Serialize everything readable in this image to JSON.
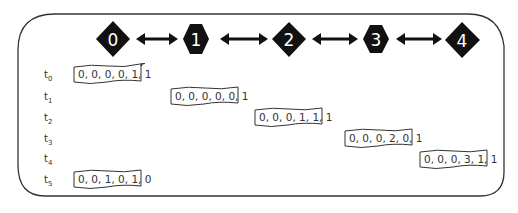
{
  "diagram": {
    "nodes": [
      {
        "id": "0",
        "label": "0",
        "shape": "diamond"
      },
      {
        "id": "1",
        "label": "1",
        "shape": "hexagon"
      },
      {
        "id": "2",
        "label": "2",
        "shape": "diamond"
      },
      {
        "id": "3",
        "label": "3",
        "shape": "hexagon"
      },
      {
        "id": "4",
        "label": "4",
        "shape": "diamond"
      }
    ],
    "edges": [
      {
        "from": "0",
        "to": "1",
        "type": "bidirectional"
      },
      {
        "from": "1",
        "to": "2",
        "type": "bidirectional"
      },
      {
        "from": "2",
        "to": "3",
        "type": "bidirectional"
      },
      {
        "from": "3",
        "to": "4",
        "type": "bidirectional"
      }
    ],
    "time_steps": [
      {
        "label": "t",
        "sub": "0",
        "node": "0",
        "vector": "0, 0, 0, 0, 1, 1"
      },
      {
        "label": "t",
        "sub": "1",
        "node": "1",
        "vector": "0, 0, 0, 0, 0, 1"
      },
      {
        "label": "t",
        "sub": "2",
        "node": "2",
        "vector": "0, 0, 0, 1, 1, 1"
      },
      {
        "label": "t",
        "sub": "3",
        "node": "3",
        "vector": "0, 0, 0, 2, 0, 1"
      },
      {
        "label": "t",
        "sub": "4",
        "node": "4",
        "vector": "0, 0, 0, 3, 1, 1"
      },
      {
        "label": "t",
        "sub": "5",
        "node": "0",
        "vector": "0, 0, 1, 0, 1, 0"
      }
    ],
    "colors": {
      "node_fill": "#111111",
      "node_text": "#ffffff",
      "border": "#333333",
      "text": "#333333"
    }
  }
}
